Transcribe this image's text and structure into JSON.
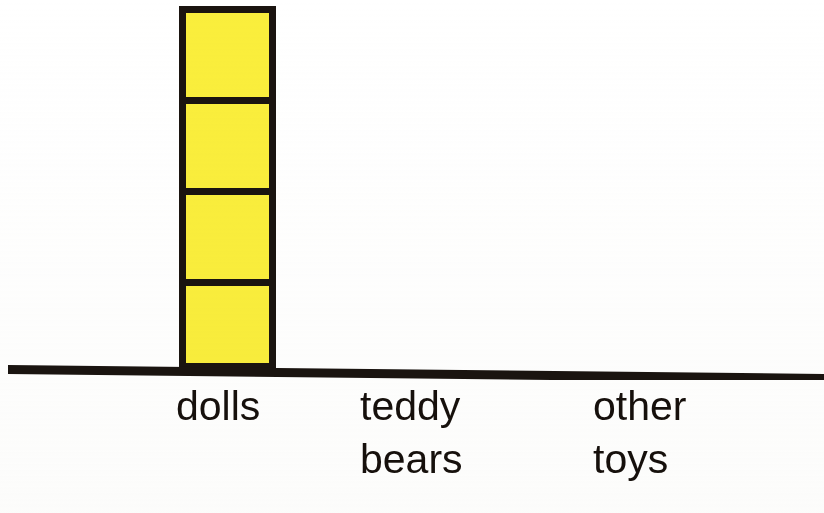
{
  "chart_data": {
    "type": "bar",
    "title": "",
    "subtitle": "",
    "xlabel": "",
    "ylabel": "",
    "categories": [
      "dolls",
      "teddy bears",
      "other toys"
    ],
    "values": [
      4,
      0,
      0
    ],
    "unit_label": "",
    "ylim": [
      0,
      4
    ],
    "grid": false,
    "legend": null,
    "style": "stacked unit squares (pictograph-style bar)",
    "bar_color": "#faee3c",
    "outline_color": "#1a1410",
    "axis_color": "#1a1410",
    "background_color": "#ffffff"
  },
  "labels": {
    "dolls": "dolls",
    "teddy_bears": "teddy\nbears",
    "other_toys": "other\ntoys"
  },
  "axis": {
    "baseline_name": "horizontal-axis-line"
  }
}
